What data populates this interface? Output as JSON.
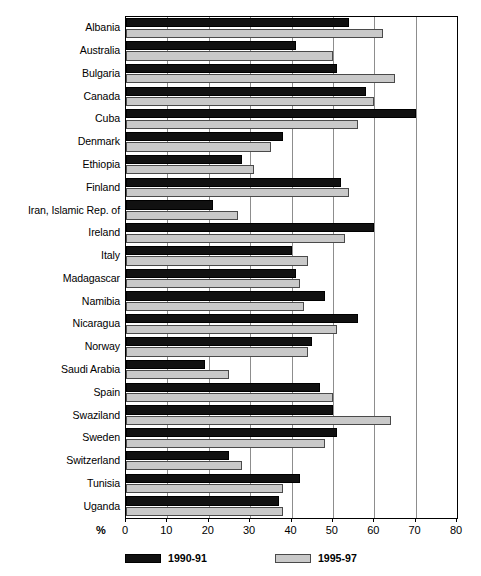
{
  "chart_data": {
    "type": "bar",
    "orientation": "horizontal",
    "title": "",
    "xlabel": "%",
    "ylabel": "",
    "xlim": [
      0,
      80
    ],
    "xticks": [
      0,
      10,
      20,
      30,
      40,
      50,
      60,
      70,
      80
    ],
    "grid": true,
    "grid_axis": "x",
    "legend_position": "bottom",
    "categories": [
      "Albania",
      "Australia",
      "Bulgaria",
      "Canada",
      "Cuba",
      "Denmark",
      "Ethiopia",
      "Finland",
      "Iran, Islamic Rep. of",
      "Ireland",
      "Italy",
      "Madagascar",
      "Namibia",
      "Nicaragua",
      "Norway",
      "Saudi Arabia",
      "Spain",
      "Swaziland",
      "Sweden",
      "Switzerland",
      "Tunisia",
      "Uganda"
    ],
    "series": [
      {
        "name": "1990-91",
        "color": "#111111",
        "values": [
          54,
          41,
          51,
          58,
          70,
          38,
          28,
          52,
          21,
          60,
          40,
          41,
          48,
          56,
          45,
          19,
          47,
          50,
          51,
          25,
          42,
          37
        ]
      },
      {
        "name": "1995-97",
        "color": "#c9c9c9",
        "values": [
          62,
          50,
          65,
          60,
          56,
          35,
          31,
          54,
          27,
          53,
          44,
          42,
          43,
          51,
          44,
          25,
          50,
          64,
          48,
          28,
          38,
          38
        ]
      }
    ]
  },
  "axis": {
    "unit_label": "%",
    "tick_labels": [
      "0",
      "10",
      "20",
      "30",
      "40",
      "50",
      "60",
      "70",
      "80"
    ]
  },
  "legend": {
    "items": [
      {
        "label": "1990-91",
        "swatch": "black-swatch"
      },
      {
        "label": "1995-97",
        "swatch": "gray-swatch"
      }
    ]
  }
}
